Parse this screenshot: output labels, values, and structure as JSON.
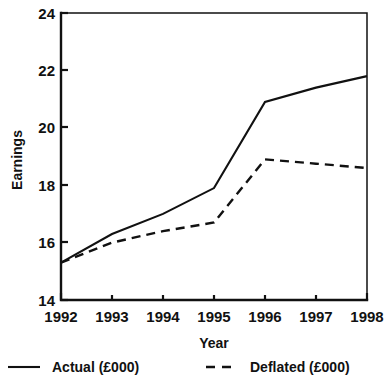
{
  "chart_data": {
    "type": "line",
    "title": "",
    "xlabel": "Year",
    "ylabel": "Earnings",
    "categories": [
      "1992",
      "1993",
      "1994",
      "1995",
      "1996",
      "1997",
      "1998"
    ],
    "x": [
      1992,
      1993,
      1994,
      1995,
      1996,
      1997,
      1998
    ],
    "xlim": [
      1992,
      1998
    ],
    "ylim": [
      14,
      24
    ],
    "yticks": [
      14,
      16,
      18,
      20,
      22,
      24
    ],
    "ytick_labels": [
      "14",
      "16",
      "18",
      "20",
      "22",
      "24"
    ],
    "xticks": [
      1992,
      1993,
      1994,
      1995,
      1996,
      1997,
      1998
    ],
    "xtick_labels": [
      "1992",
      "1993",
      "1994",
      "1995",
      "1996",
      "1997",
      "1998"
    ],
    "grid": false,
    "legend_position": "bottom",
    "series": [
      {
        "name": "Actual (£000)",
        "style": "solid",
        "color": "#111111",
        "values": [
          15.3,
          16.3,
          17.0,
          17.9,
          20.9,
          21.4,
          21.8
        ]
      },
      {
        "name": "Deflated (£000)",
        "style": "dashed",
        "color": "#111111",
        "values": [
          15.3,
          16.0,
          16.4,
          16.7,
          18.9,
          18.75,
          18.6
        ]
      }
    ]
  },
  "axes": {
    "y_title": "Earnings",
    "x_title": "Year"
  },
  "legend": {
    "items": [
      {
        "label": "Actual (£000)",
        "style": "solid"
      },
      {
        "label": "Deflated (£000)",
        "style": "dashed"
      }
    ]
  }
}
